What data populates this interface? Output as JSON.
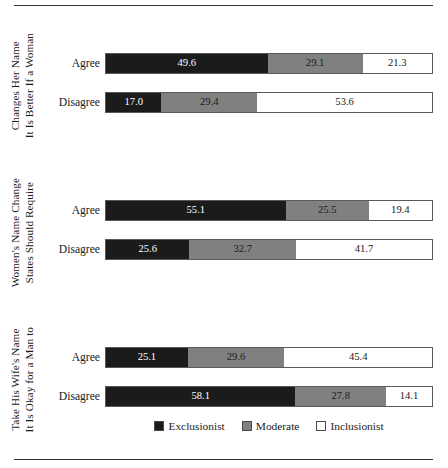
{
  "chart_data": {
    "type": "bar",
    "orientation": "horizontal",
    "stacked": true,
    "percent": true,
    "title": "",
    "xlabel": "",
    "ylabel": "",
    "xlim": [
      0,
      100
    ],
    "grid": false,
    "legend_position": "bottom",
    "legend": [
      "Exclusionist",
      "Moderate",
      "Inclusionist"
    ],
    "colors": {
      "Exclusionist": "#1b1b1b",
      "Moderate": "#808080",
      "Inclusionist": "#ffffff",
      "outline": "#5a5a5a",
      "rule": "#333333"
    },
    "categories": [
      "Agree",
      "Disagree"
    ],
    "panels": [
      {
        "title_lines": [
          "It Is Better If a Woman",
          "Changes Her Name"
        ],
        "rows": [
          {
            "category": "Agree",
            "values": [
              49.6,
              29.1,
              21.3
            ],
            "labels": [
              "49.6",
              "29.1",
              "21.3"
            ]
          },
          {
            "category": "Disagree",
            "values": [
              17.0,
              29.4,
              53.6
            ],
            "labels": [
              "17.0",
              "29.4",
              "53.6"
            ]
          }
        ]
      },
      {
        "title_lines": [
          "States Should Require",
          "Women's Name Change"
        ],
        "rows": [
          {
            "category": "Agree",
            "values": [
              55.1,
              25.5,
              19.4
            ],
            "labels": [
              "55.1",
              "25.5",
              "19.4"
            ]
          },
          {
            "category": "Disagree",
            "values": [
              25.6,
              32.7,
              41.7
            ],
            "labels": [
              "25.6",
              "32.7",
              "41.7"
            ]
          }
        ]
      },
      {
        "title_lines": [
          "It Is Okay for a Man to",
          "Take His Wife's Name"
        ],
        "rows": [
          {
            "category": "Agree",
            "values": [
              25.1,
              29.6,
              45.4
            ],
            "labels": [
              "25.1",
              "29.6",
              "45.4"
            ]
          },
          {
            "category": "Disagree",
            "values": [
              58.1,
              27.8,
              14.1
            ],
            "labels": [
              "58.1",
              "27.8",
              "14.1"
            ]
          }
        ]
      }
    ]
  },
  "legend": {
    "items": [
      {
        "label": "Exclusionist",
        "swatch": "exclusionist"
      },
      {
        "label": "Moderate",
        "swatch": "moderate"
      },
      {
        "label": "Inclusionist",
        "swatch": "inclusionist"
      }
    ]
  }
}
